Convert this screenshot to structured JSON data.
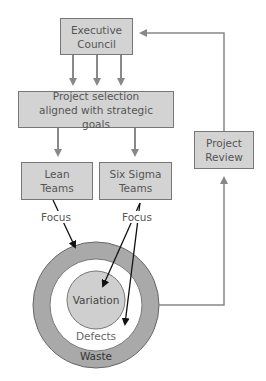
{
  "diagram": {
    "nodes": {
      "executive_council": "Executive Council",
      "project_selection": "Project selection aligned with strategic goals",
      "lean_teams": "Lean Teams",
      "six_sigma_teams": "Six Sigma Teams",
      "project_review": "Project Review"
    },
    "edge_labels": {
      "lean_focus": "Focus",
      "six_sigma_focus": "Focus"
    },
    "rings": {
      "inner": "Variation",
      "middle": "Defects",
      "outer": "Waste"
    },
    "colors": {
      "box_fill": "#d3d3d3",
      "connector": "#888888",
      "focus_arrow": "#111111",
      "outer_ring": "#a9a9a9",
      "inner_circle": "#cfcfcf"
    }
  }
}
